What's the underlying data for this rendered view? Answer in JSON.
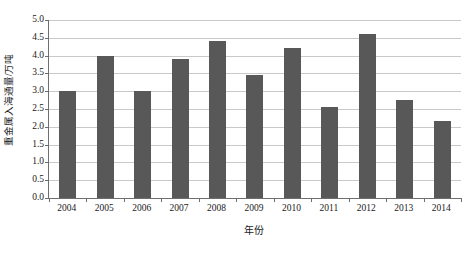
{
  "chart_data": {
    "type": "bar",
    "title": "",
    "xlabel": "年份",
    "ylabel": "重金属入海通量/万吨",
    "categories": [
      "2004",
      "2005",
      "2006",
      "2007",
      "2008",
      "2009",
      "2010",
      "2011",
      "2012",
      "2013",
      "2014"
    ],
    "values": [
      3.0,
      4.0,
      3.0,
      3.9,
      4.4,
      3.45,
      4.2,
      2.55,
      4.6,
      2.75,
      2.15
    ],
    "ylim": [
      0.0,
      5.0
    ],
    "ytick_step": 0.5,
    "yticks": [
      "5.0",
      "4.5",
      "4.0",
      "3.5",
      "3.0",
      "2.5",
      "2.0",
      "1.5",
      "1.0",
      "0.5",
      "0.0"
    ],
    "ytick_values": [
      5.0,
      4.5,
      4.0,
      3.5,
      3.0,
      2.5,
      2.0,
      1.5,
      1.0,
      0.5,
      0.0
    ],
    "grid": true,
    "legend": null,
    "legend_position": "none",
    "bar_color": "#585858",
    "gridline_color": "#c9c9c9",
    "axis_color": "#6e6e6e",
    "plot_background": "#ffffff"
  }
}
